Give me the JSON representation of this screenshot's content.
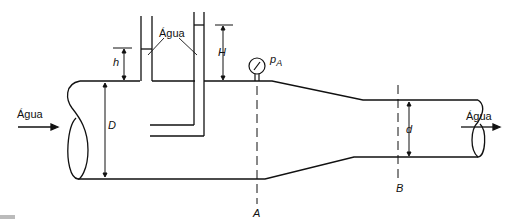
{
  "diagram": {
    "fluid_label": "Água",
    "inlet_label": "Água",
    "outlet_label": "Água",
    "tube_fluid_label": "Água",
    "piezometer_height_label": "h",
    "pitot_height_label": "H",
    "gauge_label": "p",
    "gauge_subscript": "A",
    "large_diameter_label": "D",
    "small_diameter_label": "d",
    "section_a_label": "A",
    "section_b_label": "B",
    "line_color": "#111111"
  }
}
